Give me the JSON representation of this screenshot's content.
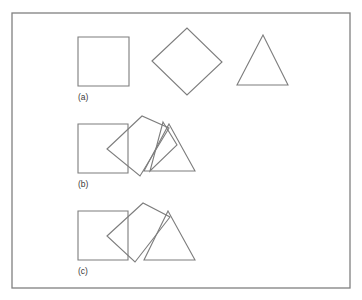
{
  "figure": {
    "title": "",
    "background_color": "#ffffff",
    "stroke_color": "#7d7d7d",
    "frame_color": "#808080",
    "label_color": "#3a3a3a",
    "frame": {
      "x": 12,
      "y": 13,
      "width": 338,
      "height": 275
    },
    "rows": [
      {
        "id": "row-a",
        "label": "(a)",
        "label_position": {
          "x": 78,
          "y": 100
        },
        "description": "Three separate shapes: square, rotated square (diamond), triangle",
        "shapes": [
          {
            "name": "square",
            "type": "polygon",
            "points": "78,37 129,37 129,86 78,86"
          },
          {
            "name": "diamond",
            "type": "polygon",
            "points": "152,61 187,28 222,62 187,95"
          },
          {
            "name": "triangle",
            "type": "polygon",
            "points": "263,35 288,85 237,85"
          }
        ]
      },
      {
        "id": "row-b",
        "label": "(b)",
        "label_position": {
          "x": 78,
          "y": 187
        },
        "description": "Overlapping shapes: square, diamond, large triangle, plus a small rotated triangle",
        "shapes": [
          {
            "name": "square",
            "type": "polygon",
            "points": "78,124 128,124 128,173 78,173"
          },
          {
            "name": "diamond",
            "type": "polygon",
            "points": "107,149 142,116 169,128 140,176"
          },
          {
            "name": "triangle-large",
            "type": "polygon",
            "points": "169,124 195,171 144,171"
          },
          {
            "name": "triangle-small-rotated",
            "type": "polygon",
            "points": "163,122 177,145 150,171"
          }
        ]
      },
      {
        "id": "row-c",
        "label": "(c)",
        "label_position": {
          "x": 78,
          "y": 274
        },
        "description": "Overlapping shapes: square, diamond, triangle",
        "shapes": [
          {
            "name": "square",
            "type": "polygon",
            "points": "78,211 128,211 128,260 78,260"
          },
          {
            "name": "diamond",
            "type": "polygon",
            "points": "107,236 143,203 170,217 135,262"
          },
          {
            "name": "triangle",
            "type": "polygon",
            "points": "168,211 195,260 144,260"
          }
        ]
      }
    ]
  }
}
